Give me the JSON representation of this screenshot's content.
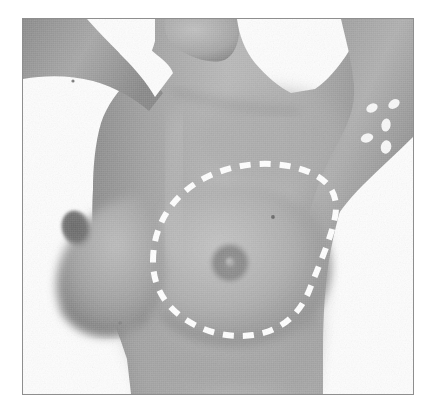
{
  "figure": {
    "domain": "medical-clinical-photograph",
    "title": "",
    "caption": "",
    "color_mode": "grayscale",
    "frame": {
      "border_color": "#8e8e8e",
      "border_width_px": 1,
      "x": 22,
      "y": 18,
      "width": 392,
      "height": 377
    },
    "page_background": "#ffffff"
  },
  "subject": {
    "description": "Female torso, oblique/anterior-oblique view, right arm raised and abducted overhead",
    "pose": "right arm elevated, body turned slightly toward viewer's right",
    "skin_tone_hex": "#a9a9a9",
    "skin_highlight_hex": "#c9c9c9",
    "skin_shadow_hex": "#838383",
    "background_hex": "#fdfdfd"
  },
  "annotations": {
    "dashed_outline": {
      "label": "surgical-marking-outline",
      "shape": "teardrop / oval skin marking encircling the right breast mound",
      "stroke_color": "#ffffff",
      "stroke_width_px": 6,
      "dash_pattern": "11 9",
      "center": {
        "x": 230,
        "y": 245
      },
      "extent": {
        "left_x": 152,
        "right_x": 334,
        "top_y": 166,
        "bottom_y": 330
      }
    },
    "skin_marks": {
      "label": "white-oval-skin-marks",
      "count": 5,
      "color": "#f8f8f8",
      "region": "right upper arm / lateral axillary area",
      "items": [
        {
          "cx": 371,
          "cy": 107,
          "rx": 6.0,
          "ry": 4.2,
          "rot": -28
        },
        {
          "cx": 393,
          "cy": 103,
          "rx": 6.2,
          "ry": 4.4,
          "rot": -35
        },
        {
          "cx": 385,
          "cy": 124,
          "rx": 4.6,
          "ry": 6.6,
          "rot": 8
        },
        {
          "cx": 366,
          "cy": 137,
          "rx": 6.4,
          "ry": 4.4,
          "rot": -18
        },
        {
          "cx": 385,
          "cy": 146,
          "rx": 5.2,
          "ry": 6.8,
          "rot": 14
        }
      ]
    },
    "nipple_areola_right": {
      "label": "right-nipple-areola",
      "cx": 229,
      "cy": 262,
      "areola_r": 21,
      "nipple_r": 4,
      "areola_color": "#8d8d8d",
      "nipple_color": "#9e9e9e"
    },
    "nipple_areola_left": {
      "label": "left-nipple-areola",
      "cx": 76,
      "cy": 228,
      "areola_rx": 15,
      "areola_ry": 19,
      "rot": -20,
      "areola_color": "#6e6e6e"
    },
    "beauty_marks": [
      {
        "label": "mole-upper-chest",
        "cx": 272,
        "cy": 216,
        "r": 1.8
      },
      {
        "label": "mole-lower-chest",
        "cx": 119,
        "cy": 322,
        "r": 1.8
      },
      {
        "label": "mole-left-arm",
        "cx": 72,
        "cy": 80,
        "r": 1.6
      }
    ]
  },
  "accessibility": {
    "alt_text": "Grayscale clinical photograph of a female torso with the right arm raised. A dashed white surgical marking outlines a teardrop-shaped region around the right breast. Five small white oval marks are placed on the right upper arm."
  }
}
